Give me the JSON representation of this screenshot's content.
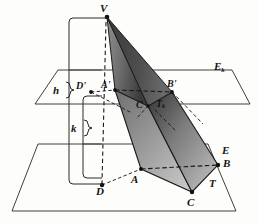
{
  "figure": {
    "type": "geometry-diagram",
    "background_color": "#fdfdfb",
    "ink_color": "#141414",
    "shade_dark": "#4a4a4a",
    "shade_mid": "#8a8a8a",
    "shade_light": "#cfcfcf"
  },
  "labels": {
    "apex": "V",
    "upper_plane": {
      "base": "E",
      "sub": "k"
    },
    "upper_solid": {
      "base": "T",
      "sub": "k"
    },
    "lower_plane": "E",
    "lower_solid": "T",
    "height_upper": "h",
    "height_lower": "k",
    "upper_points": {
      "d_prime": "D'",
      "a_prime": "A'",
      "b_prime": "B'",
      "c_prime": "C"
    },
    "lower_points": {
      "d": "D",
      "a": "A",
      "b": "B",
      "c": "C"
    }
  },
  "label_positions": [
    {
      "name": "apex-label",
      "text": "V",
      "x": 100,
      "y": 3,
      "size": "s11"
    },
    {
      "name": "upper-plane-label",
      "text": "Ek",
      "x": 214,
      "y": 62,
      "size": "s11"
    },
    {
      "name": "height-h-label",
      "text": "h",
      "x": 53,
      "y": 86,
      "size": "s11"
    },
    {
      "name": "height-k-label",
      "text": "k",
      "x": 72,
      "y": 124,
      "size": "s11"
    },
    {
      "name": "point-d-prime-label",
      "text": "D'",
      "x": 77,
      "y": 82,
      "size": "s10"
    },
    {
      "name": "point-a-prime-label",
      "text": "A'",
      "x": 101,
      "y": 81,
      "size": "s10"
    },
    {
      "name": "point-b-prime-label",
      "text": "B'",
      "x": 167,
      "y": 80,
      "size": "s10"
    },
    {
      "name": "point-c-prime-label",
      "text": "C",
      "x": 137,
      "y": 100,
      "size": "s10"
    },
    {
      "name": "upper-solid-label",
      "text": "Tk",
      "x": 157,
      "y": 99,
      "size": "s10"
    },
    {
      "name": "lower-plane-label",
      "text": "E",
      "x": 222,
      "y": 146,
      "size": "s11"
    },
    {
      "name": "point-b-label",
      "text": "B",
      "x": 223,
      "y": 159,
      "size": "s11"
    },
    {
      "name": "lower-solid-label",
      "text": "T",
      "x": 209,
      "y": 179,
      "size": "s11"
    },
    {
      "name": "point-d-label",
      "text": "D",
      "x": 96,
      "y": 186,
      "size": "s11"
    },
    {
      "name": "point-a-label",
      "text": "A",
      "x": 131,
      "y": 175,
      "size": "s11"
    },
    {
      "name": "point-c-label",
      "text": "C",
      "x": 187,
      "y": 198,
      "size": "s11"
    }
  ],
  "geometry": {
    "apex": {
      "x": 107,
      "y": 17
    },
    "upper_plane_polygon": "35,104 58,70 232,70 250,104",
    "lower_plane_polygon": "12,211 38,144 208,144 236,211",
    "upper_plane_front_edge_y": 104,
    "lower_plane_front_edge_y": 211,
    "upper_section": {
      "d_prime": {
        "x": 91,
        "y": 92
      },
      "a_prime": {
        "x": 115,
        "y": 90
      },
      "b_prime": {
        "x": 172,
        "y": 92
      },
      "c_prime": {
        "x": 148,
        "y": 106
      }
    },
    "lower_section": {
      "d": {
        "x": 102,
        "y": 185
      },
      "a": {
        "x": 141,
        "y": 169
      },
      "b": {
        "x": 218,
        "y": 165
      },
      "c": {
        "x": 192,
        "y": 192
      }
    }
  }
}
